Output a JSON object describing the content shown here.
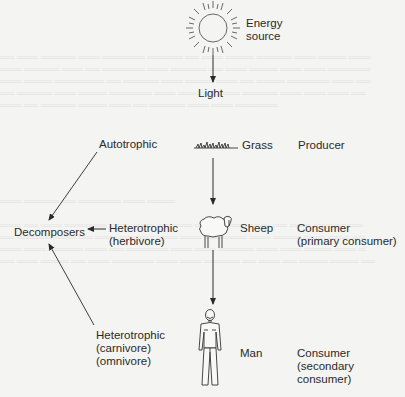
{
  "diagram": {
    "type": "food-chain",
    "energy_source": {
      "label_line1": "Energy",
      "label_line2": "source",
      "icon": "sun-icon"
    },
    "light": {
      "label": "Light"
    },
    "levels": [
      {
        "organism": "Grass",
        "icon": "grass-icon",
        "trophic_type": "Autotrophic",
        "role_line1": "Producer",
        "role_line2": ""
      },
      {
        "organism": "Sheep",
        "icon": "sheep-icon",
        "trophic_type_line1": "Heterotrophic",
        "trophic_type_line2": "(herbivore)",
        "role_line1": "Consumer",
        "role_line2": "(primary consumer)"
      },
      {
        "organism": "Man",
        "icon": "man-icon",
        "trophic_type_line1": "Heterotrophic",
        "trophic_type_line2": "(carnivore)",
        "trophic_type_line3": "(omnivore)",
        "role_line1": "Consumer",
        "role_line2": "(secondary",
        "role_line3": "consumer)"
      }
    ],
    "decomposers": {
      "label": "Decomposers"
    },
    "arrows": [
      {
        "from": "Energy source",
        "to": "Light"
      },
      {
        "from": "Grass",
        "to": "Sheep"
      },
      {
        "from": "Sheep",
        "to": "Man"
      },
      {
        "from": "Autotrophic",
        "to": "Decomposers"
      },
      {
        "from": "Heterotrophic (herbivore)",
        "to": "Decomposers"
      },
      {
        "from": "Heterotrophic (carnivore)(omnivore)",
        "to": "Decomposers"
      }
    ],
    "colors": {
      "ink": "#2a2a2a",
      "paper": "#f4f4f2"
    }
  }
}
